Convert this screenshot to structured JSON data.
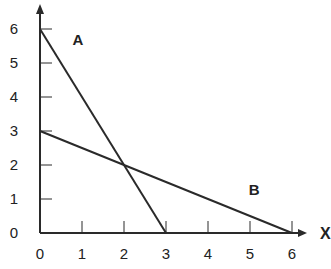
{
  "chart_data": {
    "type": "line",
    "title": "",
    "xlabel": "X",
    "ylabel": "",
    "xlim": [
      0,
      6
    ],
    "ylim": [
      0,
      6
    ],
    "grid": false,
    "x_ticks": [
      "0",
      "1",
      "2",
      "3",
      "4",
      "5",
      "6"
    ],
    "y_ticks": [
      "0",
      "1",
      "2",
      "3",
      "4",
      "5",
      "6"
    ],
    "series": [
      {
        "name": "A",
        "points": [
          [
            0,
            6
          ],
          [
            3,
            0
          ]
        ]
      },
      {
        "name": "B",
        "points": [
          [
            0,
            3
          ],
          [
            6,
            0
          ]
        ]
      }
    ],
    "annotations": [
      {
        "text": "A",
        "x": 0.9,
        "y": 5.7
      },
      {
        "text": "B",
        "x": 5.1,
        "y": 1.3
      }
    ],
    "intersection": [
      2,
      2
    ]
  },
  "colors": {
    "line": "#2a2a2a",
    "text": "#222222"
  }
}
